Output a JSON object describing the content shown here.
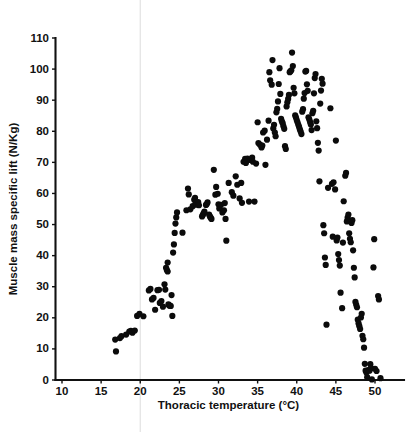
{
  "chart_data": {
    "type": "scatter",
    "title": "",
    "subtitle": "",
    "xlabel": "Thoracic temperature (°C)",
    "ylabel": "Muscle mass specific lift (N/Kg)",
    "xlim": [
      10,
      52
    ],
    "ylim": [
      0,
      110
    ],
    "xticks": [
      10,
      15,
      20,
      25,
      30,
      35,
      40,
      45,
      50
    ],
    "yticks": [
      0,
      10,
      20,
      30,
      40,
      50,
      60,
      70,
      80,
      90,
      100,
      110
    ],
    "xtick_labels": [
      "10",
      "15",
      "20",
      "25",
      "30",
      "35",
      "40",
      "45",
      "50"
    ],
    "ytick_labels": [
      "0",
      "10",
      "20",
      "30",
      "40",
      "50",
      "60",
      "70",
      "80",
      "90",
      "100",
      "110"
    ],
    "grid": false,
    "legend": null,
    "legend_position": "none",
    "marker": "filled-circle",
    "marker_color": "#0b0b0b",
    "marker_size_px": 3.1,
    "annotations": [],
    "series": [
      {
        "name": "Muscle mass specific lift vs thoracic temperature",
        "n_points": 229,
        "points": [
          [
            16.8,
            13.0
          ],
          [
            16.9,
            9.2
          ],
          [
            17.4,
            13.5
          ],
          [
            17.6,
            14.1
          ],
          [
            18.2,
            14.6
          ],
          [
            18.6,
            15.6
          ],
          [
            18.8,
            15.8
          ],
          [
            19.0,
            15.2
          ],
          [
            19.3,
            15.9
          ],
          [
            19.6,
            20.6
          ],
          [
            19.9,
            21.3
          ],
          [
            20.4,
            20.5
          ],
          [
            21.1,
            28.8
          ],
          [
            21.3,
            29.3
          ],
          [
            21.5,
            25.9
          ],
          [
            21.7,
            26.4
          ],
          [
            21.9,
            22.6
          ],
          [
            22.2,
            28.9
          ],
          [
            22.4,
            29.0
          ],
          [
            22.5,
            24.8
          ],
          [
            22.7,
            25.4
          ],
          [
            22.9,
            23.6
          ],
          [
            23.1,
            30.8
          ],
          [
            23.2,
            29.1
          ],
          [
            23.3,
            36.1
          ],
          [
            23.4,
            35.4
          ],
          [
            23.5,
            34.9
          ],
          [
            23.5,
            37.8
          ],
          [
            23.6,
            24.3
          ],
          [
            23.7,
            24.0
          ],
          [
            23.8,
            23.9
          ],
          [
            23.9,
            23.8
          ],
          [
            24.0,
            27.3
          ],
          [
            24.1,
            20.6
          ],
          [
            24.2,
            41.0
          ],
          [
            24.3,
            43.6
          ],
          [
            24.4,
            47.3
          ],
          [
            24.5,
            50.3
          ],
          [
            24.6,
            52.3
          ],
          [
            24.7,
            53.9
          ],
          [
            25.4,
            47.4
          ],
          [
            25.9,
            54.6
          ],
          [
            26.1,
            61.6
          ],
          [
            26.2,
            59.7
          ],
          [
            26.4,
            54.9
          ],
          [
            26.7,
            55.9
          ],
          [
            26.9,
            58.0
          ],
          [
            27.0,
            58.6
          ],
          [
            27.1,
            57.0
          ],
          [
            27.2,
            56.4
          ],
          [
            27.4,
            57.2
          ],
          [
            27.5,
            56.2
          ],
          [
            27.9,
            52.6
          ],
          [
            28.0,
            53.1
          ],
          [
            28.1,
            53.6
          ],
          [
            28.2,
            54.2
          ],
          [
            28.4,
            56.3
          ],
          [
            28.5,
            56.6
          ],
          [
            28.6,
            57.1
          ],
          [
            28.8,
            53.2
          ],
          [
            28.9,
            52.6
          ],
          [
            29.0,
            52.2
          ],
          [
            29.1,
            51.8
          ],
          [
            29.4,
            67.6
          ],
          [
            29.6,
            59.6
          ],
          [
            29.7,
            62.1
          ],
          [
            29.9,
            59.9
          ],
          [
            30.0,
            56.5
          ],
          [
            30.1,
            55.2
          ],
          [
            30.3,
            56.3
          ],
          [
            30.5,
            53.9
          ],
          [
            30.7,
            54.6
          ],
          [
            30.8,
            56.9
          ],
          [
            30.9,
            51.8
          ],
          [
            31.0,
            44.8
          ],
          [
            31.3,
            63.4
          ],
          [
            31.7,
            60.4
          ],
          [
            31.9,
            59.3
          ],
          [
            32.2,
            65.5
          ],
          [
            32.4,
            62.8
          ],
          [
            32.7,
            58.4
          ],
          [
            32.9,
            63.4
          ],
          [
            33.0,
            57.0
          ],
          [
            33.2,
            70.2
          ],
          [
            33.4,
            71.1
          ],
          [
            33.5,
            69.8
          ],
          [
            33.6,
            70.6
          ],
          [
            33.7,
            71.2
          ],
          [
            33.9,
            57.4
          ],
          [
            34.1,
            70.8
          ],
          [
            34.3,
            71.5
          ],
          [
            34.4,
            70.2
          ],
          [
            34.6,
            57.4
          ],
          [
            34.8,
            69.6
          ],
          [
            35.0,
            82.9
          ],
          [
            35.1,
            76.2
          ],
          [
            35.3,
            75.7
          ],
          [
            35.5,
            74.8
          ],
          [
            35.6,
            75.4
          ],
          [
            35.7,
            79.6
          ],
          [
            35.9,
            80.2
          ],
          [
            36.0,
            69.2
          ],
          [
            36.2,
            77.3
          ],
          [
            36.4,
            83.4
          ],
          [
            36.5,
            99.0
          ],
          [
            36.6,
            96.4
          ],
          [
            36.8,
            95.0
          ],
          [
            36.9,
            102.9
          ],
          [
            37.0,
            80.9
          ],
          [
            37.1,
            82.1
          ],
          [
            37.2,
            79.6
          ],
          [
            37.3,
            78.4
          ],
          [
            37.4,
            86.1
          ],
          [
            37.5,
            87.2
          ],
          [
            37.6,
            89.6
          ],
          [
            37.7,
            95.2
          ],
          [
            37.8,
            100.3
          ],
          [
            37.9,
            92.0
          ],
          [
            38.0,
            84.0
          ],
          [
            38.1,
            83.2
          ],
          [
            38.2,
            82.6
          ],
          [
            38.3,
            81.6
          ],
          [
            38.4,
            80.8
          ],
          [
            38.5,
            75.2
          ],
          [
            38.6,
            74.3
          ],
          [
            38.7,
            88.0
          ],
          [
            38.8,
            89.3
          ],
          [
            38.9,
            90.4
          ],
          [
            39.0,
            91.7
          ],
          [
            39.1,
            99.0
          ],
          [
            39.2,
            99.3
          ],
          [
            39.3,
            99.6
          ],
          [
            39.4,
            105.3
          ],
          [
            39.5,
            101.0
          ],
          [
            39.6,
            94.0
          ],
          [
            39.7,
            92.2
          ],
          [
            39.8,
            85.1
          ],
          [
            39.9,
            84.4
          ],
          [
            40.0,
            83.6
          ],
          [
            40.1,
            82.9
          ],
          [
            40.2,
            82.1
          ],
          [
            40.3,
            81.4
          ],
          [
            40.4,
            80.6
          ],
          [
            40.5,
            79.9
          ],
          [
            40.6,
            79.1
          ],
          [
            40.7,
            86.3
          ],
          [
            40.8,
            87.1
          ],
          [
            40.9,
            90.5
          ],
          [
            41.0,
            92.3
          ],
          [
            41.1,
            99.2
          ],
          [
            41.2,
            99.4
          ],
          [
            41.3,
            95.1
          ],
          [
            41.4,
            93.0
          ],
          [
            41.5,
            84.5
          ],
          [
            41.6,
            83.8
          ],
          [
            41.7,
            83.0
          ],
          [
            41.8,
            82.2
          ],
          [
            41.9,
            80.4
          ],
          [
            42.0,
            85.8
          ],
          [
            42.1,
            86.6
          ],
          [
            42.2,
            92.2
          ],
          [
            42.3,
            97.1
          ],
          [
            42.4,
            98.4
          ],
          [
            42.5,
            83.2
          ],
          [
            42.6,
            81.0
          ],
          [
            42.7,
            76.3
          ],
          [
            42.8,
            73.8
          ],
          [
            42.9,
            63.9
          ],
          [
            43.0,
            88.9
          ],
          [
            43.1,
            93.1
          ],
          [
            43.2,
            96.9
          ],
          [
            43.3,
            95.3
          ],
          [
            43.4,
            49.8
          ],
          [
            43.5,
            47.2
          ],
          [
            43.6,
            39.4
          ],
          [
            43.7,
            37.0
          ],
          [
            43.8,
            17.8
          ],
          [
            44.0,
            61.8
          ],
          [
            44.3,
            87.4
          ],
          [
            44.5,
            63.1
          ],
          [
            44.7,
            63.6
          ],
          [
            44.9,
            61.3
          ],
          [
            45.0,
            77.0
          ],
          [
            45.1,
            44.9
          ],
          [
            45.2,
            45.8
          ],
          [
            45.3,
            40.5
          ],
          [
            45.4,
            38.6
          ],
          [
            45.5,
            36.8
          ],
          [
            45.6,
            28.1
          ],
          [
            45.8,
            23.1
          ],
          [
            46.0,
            57.5
          ],
          [
            46.2,
            65.7
          ],
          [
            46.3,
            66.6
          ],
          [
            46.4,
            51.0
          ],
          [
            46.5,
            52.2
          ],
          [
            46.6,
            53.2
          ],
          [
            46.7,
            47.2
          ],
          [
            46.8,
            45.4
          ],
          [
            46.9,
            44.3
          ],
          [
            47.0,
            50.5
          ],
          [
            47.1,
            51.4
          ],
          [
            47.2,
            41.7
          ],
          [
            47.3,
            36.1
          ],
          [
            47.4,
            33.0
          ],
          [
            47.5,
            25.1
          ],
          [
            47.6,
            24.2
          ],
          [
            47.7,
            23.4
          ],
          [
            47.8,
            19.4
          ],
          [
            47.9,
            18.2
          ],
          [
            48.0,
            17.3
          ],
          [
            48.1,
            16.4
          ],
          [
            48.2,
            20.1
          ],
          [
            48.3,
            21.3
          ],
          [
            48.4,
            14.2
          ],
          [
            48.5,
            13.1
          ],
          [
            48.6,
            10.4
          ],
          [
            48.7,
            5.2
          ],
          [
            48.8,
            3.0
          ],
          [
            48.9,
            2.4
          ],
          [
            49.0,
            0.9
          ],
          [
            49.1,
            3.1
          ],
          [
            49.2,
            3.2
          ],
          [
            49.3,
            3.0
          ],
          [
            49.4,
            5.1
          ],
          [
            49.5,
            3.8
          ],
          [
            49.6,
            0.2
          ],
          [
            49.8,
            36.2
          ],
          [
            49.9,
            45.3
          ],
          [
            50.0,
            3.6
          ],
          [
            50.2,
            2.9
          ],
          [
            50.4,
            27.0
          ],
          [
            50.5,
            25.9
          ],
          [
            50.7,
            0.6
          ],
          [
            44.6,
            46.1
          ],
          [
            45.9,
            44.2
          ]
        ]
      }
    ]
  },
  "figure": {
    "background_color": "#ffffff",
    "axis_color": "#111111",
    "fold_line_color": "#e2e2e2",
    "fold_line_x_value": 20
  }
}
